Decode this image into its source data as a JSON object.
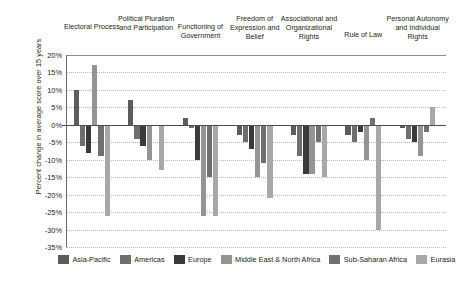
{
  "chart_data": {
    "type": "bar",
    "title": "",
    "subtitle": "",
    "xlabel": "",
    "ylabel": "Percent change in average score over 15 years",
    "ylim": [
      -35,
      20
    ],
    "ytick_step": 5,
    "ytick_labels": [
      "20%",
      "15%",
      "10%",
      "5%",
      "0%",
      "-5%",
      "-10%",
      "-15%",
      "-20%",
      "-25%",
      "-30%",
      "-35%"
    ],
    "ytick_values": [
      20,
      15,
      10,
      5,
      0,
      -5,
      -10,
      -15,
      -20,
      -25,
      -30,
      -35
    ],
    "grid": true,
    "grid_axis": "y",
    "legend_position": "bottom",
    "value_format": "percent",
    "categories": [
      "Electoral Process",
      "Political Pluralism and Participation",
      "Functioning of Government",
      "Freedom of Expression and Belief",
      "Associational and Organizational Rights",
      "Rule of Law",
      "Personal Autonomy and Individual Rights"
    ],
    "series": [
      {
        "name": "Asia-Pacific",
        "color": "#5c5c5c",
        "values": [
          10,
          7,
          2,
          -3,
          -3,
          -3,
          -1
        ]
      },
      {
        "name": "Americas",
        "color": "#6e6e6e",
        "values": [
          -6,
          -4,
          -1,
          -5,
          -9,
          -5,
          -4
        ]
      },
      {
        "name": "Europe",
        "color": "#3a3a3a",
        "values": [
          -8,
          -6,
          -10,
          -7,
          -14,
          -2,
          -5
        ]
      },
      {
        "name": "Middle East & North Africa",
        "color": "#949494",
        "values": [
          17,
          -10,
          -26,
          -15,
          -14,
          -10,
          -9
        ]
      },
      {
        "name": "Sub-Saharan Africa",
        "color": "#707070",
        "values": [
          -9,
          0,
          -15,
          -11,
          -5,
          2,
          -2
        ]
      },
      {
        "name": "Eurasia",
        "color": "#a8a8a8",
        "values": [
          -26,
          -13,
          -26,
          -21,
          -15,
          -30,
          5
        ]
      }
    ]
  },
  "legend": {
    "items": [
      {
        "label": "Asia-Pacific",
        "color": "#5c5c5c"
      },
      {
        "label": "Americas",
        "color": "#6e6e6e"
      },
      {
        "label": "Europe",
        "color": "#3a3a3a"
      },
      {
        "label": "Middle East & North Africa",
        "color": "#949494"
      },
      {
        "label": "Sub-Saharan Africa",
        "color": "#707070"
      },
      {
        "label": "Eurasia",
        "color": "#a8a8a8"
      }
    ]
  }
}
